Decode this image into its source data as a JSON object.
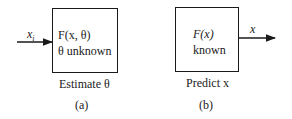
{
  "panel_a": {
    "input_label": "x",
    "input_sub": "i",
    "box_line1": "F(x, θ)",
    "box_line2": "θ unknown",
    "caption": "Estimate θ",
    "label": "(a)"
  },
  "panel_b": {
    "output_label": "x",
    "box_line1": "F(x)",
    "box_line2": "known",
    "caption": "Predict x",
    "label": "(b)"
  }
}
